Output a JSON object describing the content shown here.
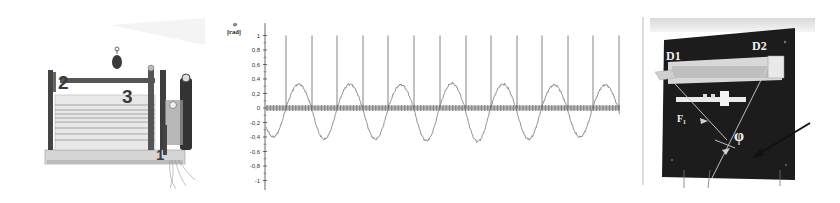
{
  "figure": {
    "panels": [
      {
        "id": "left-photo",
        "description": "Photograph of torsion-wave apparatus",
        "labels": [
          "2",
          "3",
          "1"
        ]
      },
      {
        "id": "chart",
        "description": "Angle vs time waveform"
      },
      {
        "id": "right-photo",
        "description": "Photograph of board with detectors",
        "labels": [
          "D1",
          "D2",
          "F1",
          "φ"
        ]
      }
    ]
  },
  "left_photo": {
    "label_2": "2",
    "label_3": "3",
    "label_1": "1"
  },
  "right_photo": {
    "label_d1": "D1",
    "label_d2": "D2",
    "label_f1": "F₁",
    "label_phi": "φ"
  },
  "chart_data": {
    "type": "line",
    "title": "",
    "ylabel_symbol": "φ",
    "ylabel_unit": "[rad]",
    "xlabel": "",
    "ylim": [
      -1,
      1
    ],
    "yticks": [
      1,
      0.8,
      0.6,
      0.4,
      0.2,
      0,
      -0.2,
      -0.4,
      -0.6,
      -0.8,
      -1
    ],
    "ytick_labels": [
      "1",
      "0,8",
      "0,6",
      "0,4",
      "0,2",
      "0",
      "-0,2",
      "-0,4",
      "-0,6",
      "-0,8",
      "-1"
    ],
    "grid": false,
    "series": [
      {
        "name": "angle",
        "style": "sinusoid with noise",
        "amplitude_positive": 0.33,
        "amplitude_negative": -0.42,
        "cycles": 7,
        "peaks": [
          0.33,
          0.33,
          0.32,
          0.34,
          0.33,
          0.32,
          0.32
        ],
        "troughs": [
          -0.4,
          -0.43,
          -0.43,
          -0.45,
          -0.46,
          -0.43,
          -0.4
        ]
      },
      {
        "name": "gate pulses",
        "style": "vertical spikes to 1.0",
        "count": 14,
        "spike_height": 1.0
      },
      {
        "name": "baseline markers",
        "style": "dense marker band at 0",
        "value": 0
      }
    ]
  }
}
